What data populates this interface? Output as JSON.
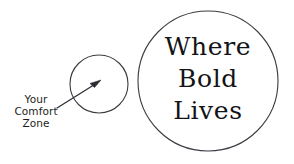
{
  "canvas": {
    "width": 294,
    "height": 164,
    "background_color": "#ffffff"
  },
  "theme": {
    "stroke_color": "#3b3b42",
    "arrow_color": "#2b2b30",
    "text_color": "#131317",
    "label_color": "#1d1d21"
  },
  "shapes": {
    "small_circle": {
      "name": "comfort-zone-circle",
      "cx": 99,
      "cy": 84,
      "r": 29,
      "fill": "#ffffff",
      "stroke": "#3b3b42"
    },
    "large_circle": {
      "name": "where-bold-lives-circle",
      "cx": 208,
      "cy": 81,
      "r": 70,
      "fill": "#ffffff",
      "stroke": "#3b3b42"
    },
    "arrow": {
      "name": "pointer-arrow",
      "from_x": 57,
      "from_y": 108,
      "to_x": 100,
      "to_y": 81,
      "color": "#2b2b30"
    }
  },
  "labels": {
    "comfort_zone": {
      "lines": [
        "Your",
        "Comfort",
        "Zone"
      ],
      "line1": "Your",
      "line2": "Comfort",
      "line3": "Zone"
    },
    "bold_circle": {
      "lines": [
        "Where",
        "Bold",
        "Lives"
      ],
      "line1": "Where",
      "line2": "Bold",
      "line3": "Lives"
    }
  }
}
